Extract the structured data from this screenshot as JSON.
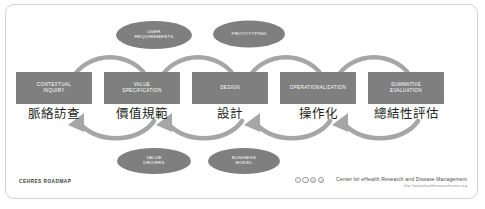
{
  "diagram": {
    "title": "CEHRES ROADMAP",
    "colors": {
      "box_fill": "#7f7f7f",
      "ellipse_fill": "#7f7f7f",
      "arrow_fill": "#a6a6a6",
      "arc_label": "#ffffff",
      "frame_border": "#d2d2d2",
      "cn_text": "#231f20"
    },
    "phases": [
      {
        "label": "CONTEXTUAL\nINQUIRY",
        "label_cn": "脈絡訪查"
      },
      {
        "label": "VALUE\nSPECIFICATION",
        "label_cn": "價值規範"
      },
      {
        "label": "DESIGN",
        "label_cn": "設計"
      },
      {
        "label": "OPERATIONALIZATION",
        "label_cn": "操作化"
      },
      {
        "label": "SUMMATIVE\nEVALUATION",
        "label_cn": "總結性評估"
      }
    ],
    "top_ellipses": [
      {
        "label": "USER\nREQUIREMENTS"
      },
      {
        "label": "PROTOTYPING"
      }
    ],
    "bottom_ellipses": [
      {
        "label": "VALUE\nDRIVERS"
      },
      {
        "label": "BUSINESS\nMODEL"
      }
    ],
    "arc_labels": [
      "FORMATIVE EVALUATION",
      "FORMATIVE EVALUATION",
      "FORMATIVE EVALUATION",
      "FORMATIVE EVALUATION"
    ],
    "footer": {
      "roadmap_label": "CEHRES ROADMAP",
      "credit": "Center for eHealth Research and Disease Management",
      "url": "http://www.ehealthresearchcenter.org",
      "cc_badges": [
        "cc",
        "by",
        "nc",
        "sa"
      ],
      "cc_glyphs": [
        "ⓒ",
        "ⓘ",
        "Ⓢ",
        "ⓐ"
      ]
    }
  }
}
